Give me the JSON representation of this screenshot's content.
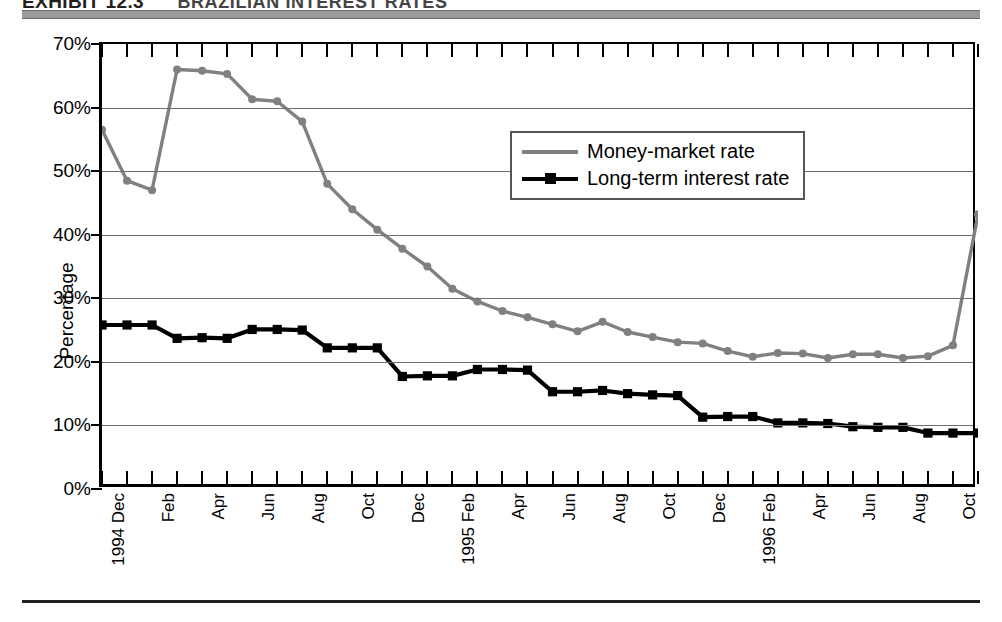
{
  "exhibit": {
    "label": "EXHIBIT",
    "number": "12.3",
    "title": "BRAZILIAN INTEREST RATES"
  },
  "legend": {
    "position": "inside-top-center",
    "items": [
      {
        "label": "Money-market rate",
        "color": "#808080",
        "marker": "circle"
      },
      {
        "label": "Long-term interest rate",
        "color": "#000000",
        "marker": "square"
      }
    ]
  },
  "axes": {
    "ylabel": "Percentage",
    "ytick_labels": [
      "70%",
      "60%",
      "50%",
      "40%",
      "30%",
      "20%",
      "10%",
      "0%"
    ],
    "xtick_labels": [
      "1994 Dec",
      "",
      "Feb",
      "",
      "Apr",
      "",
      "Jun",
      "",
      "Aug",
      "",
      "Oct",
      "",
      "Dec",
      "",
      "1995 Feb",
      "",
      "Apr",
      "",
      "Jun",
      "",
      "Aug",
      "",
      "Oct",
      "",
      "Dec",
      "",
      "1996 Feb",
      "",
      "Apr",
      "",
      "Jun",
      "",
      "Aug",
      "",
      "Oct",
      ""
    ]
  },
  "chart_data": {
    "type": "line",
    "title": "BRAZILIAN INTEREST RATES",
    "xlabel": "",
    "ylabel": "Percentage",
    "ylim": [
      0,
      70
    ],
    "grid": true,
    "legend_position": "inside-top-center",
    "categories": [
      "1994 Dec",
      "1995 Jan",
      "1995 Feb",
      "1995 Mar",
      "1995 Apr",
      "1995 May",
      "1995 Jun",
      "1995 Jul",
      "1995 Aug",
      "1995 Sep",
      "1995 Oct",
      "1995 Nov",
      "1995 Dec",
      "1996 Jan",
      "1996 Feb",
      "1996 Mar",
      "1996 Apr",
      "1996 May",
      "1996 Jun",
      "1996 Jul",
      "1996 Aug",
      "1996 Sep",
      "1996 Oct",
      "1996 Nov",
      "1996 Dec",
      "1997 Jan",
      "1997 Feb",
      "1997 Mar",
      "1997 Apr",
      "1997 May",
      "1997 Jun",
      "1997 Jul",
      "1997 Aug",
      "1997 Sep",
      "1997 Oct",
      "1997 Nov"
    ],
    "x_tick_text": [
      "1994 Dec",
      "",
      "Feb",
      "",
      "Apr",
      "",
      "Jun",
      "",
      "Aug",
      "",
      "Oct",
      "",
      "Dec",
      "",
      "1995 Feb",
      "",
      "Apr",
      "",
      "Jun",
      "",
      "Aug",
      "",
      "Oct",
      "",
      "Dec",
      "",
      "1996 Feb",
      "",
      "Apr",
      "",
      "Jun",
      "",
      "Aug",
      "",
      "Oct",
      ""
    ],
    "series": [
      {
        "name": "Money-market rate",
        "color": "#808080",
        "marker": "circle",
        "values": [
          56.5,
          48.5,
          47.0,
          66.0,
          65.8,
          65.3,
          61.3,
          61.0,
          57.8,
          48.0,
          44.0,
          40.8,
          37.8,
          35.0,
          31.5,
          29.5,
          28.0,
          27.0,
          25.9,
          24.8,
          26.3,
          24.7,
          23.9,
          23.1,
          22.9,
          21.7,
          20.8,
          21.4,
          21.3,
          20.6,
          21.2,
          21.2,
          20.6,
          20.9,
          22.6,
          43.2
        ]
      },
      {
        "name": "Long-term interest rate",
        "color": "#000000",
        "marker": "square",
        "values": [
          25.8,
          25.8,
          25.8,
          23.7,
          23.8,
          23.7,
          25.1,
          25.1,
          25.0,
          22.2,
          22.2,
          22.2,
          17.7,
          17.8,
          17.8,
          18.8,
          18.8,
          18.7,
          15.3,
          15.3,
          15.5,
          15.0,
          14.8,
          14.7,
          11.3,
          11.4,
          11.4,
          10.4,
          10.4,
          10.3,
          9.8,
          9.7,
          9.7,
          8.8,
          8.8,
          8.8
        ]
      }
    ]
  }
}
